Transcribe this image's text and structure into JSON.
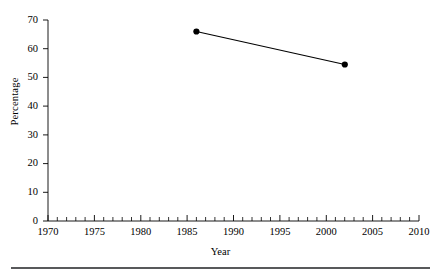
{
  "chart_data": {
    "type": "line",
    "title": "",
    "xlabel": "Year",
    "ylabel": "Percentage",
    "xlim": [
      1970,
      2010
    ],
    "ylim": [
      0,
      70
    ],
    "xticks": [
      1970,
      1975,
      1980,
      1985,
      1990,
      1995,
      2000,
      2005,
      2010
    ],
    "xtick_labels": [
      "1970",
      "1975",
      "1980",
      "1985",
      "1990",
      "1995",
      "2000",
      "2005",
      "2010"
    ],
    "x_minor_tick_step": 1,
    "yticks": [
      0,
      10,
      20,
      30,
      40,
      50,
      60,
      70
    ],
    "ytick_labels": [
      "0",
      "10",
      "20",
      "30",
      "40",
      "50",
      "60",
      "70"
    ],
    "grid": false,
    "legend": false,
    "marker": "filled-circle",
    "line_color": "#000000",
    "marker_color": "#000000",
    "axis_color": "#000000",
    "background_color": "#ffffff",
    "x": [
      1986,
      2002
    ],
    "values": [
      66,
      54.5
    ],
    "points": [
      {
        "x": 1986,
        "y": 66
      },
      {
        "x": 2002,
        "y": 54.5
      }
    ],
    "series": [
      {
        "name": "Percentage",
        "x": [
          1986,
          2002
        ],
        "values": [
          66,
          54.5
        ]
      }
    ]
  },
  "figure": {
    "bottom_rule_color": "#58595b"
  }
}
